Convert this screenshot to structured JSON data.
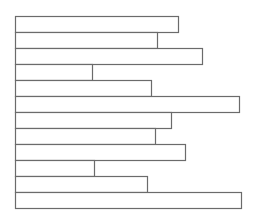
{
  "chart_data": {
    "type": "bar",
    "orientation": "horizontal",
    "title": "",
    "xlabel": "",
    "ylabel": "",
    "categories": [
      "1",
      "2",
      "3",
      "4",
      "5",
      "6",
      "7",
      "8",
      "9",
      "10",
      "11",
      "12"
    ],
    "values": [
      163,
      142,
      187,
      77,
      136,
      224,
      156,
      140,
      170,
      79,
      132,
      226
    ],
    "xlim": [
      0,
      246
    ],
    "grid": false,
    "legend": null,
    "style": {
      "stroke": "#6b6b6b",
      "fill": "#ffffff",
      "origin_x": 15,
      "top_y": 16,
      "bar_height": 16
    }
  }
}
